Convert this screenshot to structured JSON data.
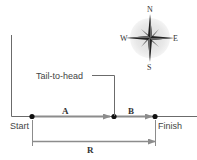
{
  "diagram": {
    "type": "vector-addition",
    "labels": {
      "start": "Start",
      "finish": "Finish",
      "tail_to_head": "Tail-to-head",
      "vector_a": "A",
      "vector_b": "B",
      "resultant": "R"
    },
    "compass": {
      "north": "N",
      "south": "S",
      "east": "E",
      "west": "W"
    },
    "colors": {
      "axis_line": "#6b6b6b",
      "vector_arrow": "#8c8c8c",
      "dot": "#111111",
      "compass_halo": "#e6e6e6",
      "compass_star": "#222222"
    }
  }
}
